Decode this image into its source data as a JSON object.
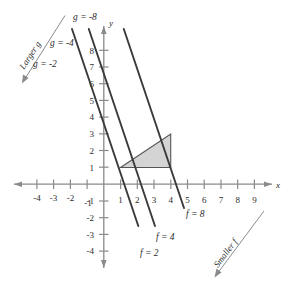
{
  "figure": {
    "title": "",
    "axes": {
      "x_axis_label": "x",
      "y_axis_label": "y",
      "x_ticks": [
        -4,
        -3,
        -2,
        -1,
        1,
        2,
        3,
        4,
        5,
        6,
        7,
        8,
        9
      ],
      "x_tick_labels": [
        "-4",
        "-3",
        "-2",
        "-1",
        "1",
        "2",
        "3",
        "4",
        "5",
        "6",
        "7",
        "8",
        "9"
      ],
      "y_ticks": [
        -4,
        -3,
        -2,
        -1,
        1,
        2,
        3,
        4,
        5,
        6,
        7,
        8
      ],
      "y_tick_labels": [
        "-4",
        "-3",
        "-2",
        "-1",
        "1",
        "2",
        "3",
        "4",
        "5",
        "6",
        "7",
        "8"
      ]
    },
    "annotations": {
      "larger_g": "Larger g",
      "smaller_f": "Smaller f",
      "g_label_1": "g = -8",
      "g_label_2": "g = -4",
      "g_label_3": "g = -2",
      "f_label_1": "f = 8",
      "f_label_2": "f = 4",
      "f_label_3": "f = 2"
    },
    "colors": {
      "line": "#3a3a3a",
      "axis": "#8a8a8a",
      "region_fill": "#d4d4d4",
      "region_stroke": "#555555",
      "text": "#2b2b2b"
    }
  },
  "chart_data": {
    "type": "line",
    "title": "",
    "xlabel": "x",
    "ylabel": "y",
    "xlim": [
      -5,
      10
    ],
    "ylim": [
      -5,
      9
    ],
    "grid": false,
    "legend": "none",
    "series": [
      {
        "name": "f = 2",
        "label": "f = 2",
        "slope": -3,
        "intercept": 3.6,
        "x_intercept": 1.2,
        "points": [
          [
            0.35,
            2.6
          ],
          [
            2.05,
            -2.5
          ]
        ]
      },
      {
        "name": "f = 4",
        "label": "f = 4",
        "slope": -3,
        "intercept": 6.6,
        "x_intercept": 2.2,
        "points": [
          [
            1.35,
            2.6
          ],
          [
            3.1,
            -2.6
          ]
        ]
      },
      {
        "name": "f = 8",
        "label": "f = 8",
        "slope": -3,
        "intercept": 12.9,
        "x_intercept": 4.3,
        "points": [
          [
            3.0,
            3.9
          ],
          [
            4.8,
            -1.4
          ]
        ]
      },
      {
        "name": "g = -2",
        "label": "g = -2",
        "slope": -3,
        "intercept": 3.6,
        "note": "upper-left extension of f = 2 line",
        "points": [
          [
            -1.9,
            9.3
          ],
          [
            0.35,
            2.6
          ]
        ]
      },
      {
        "name": "g = -4",
        "label": "g = -4",
        "slope": -3,
        "intercept": 6.6,
        "note": "upper-left extension of f = 4 line",
        "points": [
          [
            -0.9,
            9.3
          ],
          [
            1.35,
            2.6
          ]
        ]
      },
      {
        "name": "g = -8",
        "label": "g = -8",
        "slope": -3,
        "intercept": 12.9,
        "note": "upper-left extension of f = 8 line",
        "points": [
          [
            1.1,
            9.6
          ],
          [
            3.0,
            3.9
          ]
        ]
      }
    ],
    "shaded_region": {
      "name": "feasible-region",
      "type": "polygon",
      "vertices": [
        [
          1,
          1
        ],
        [
          4,
          1
        ],
        [
          4,
          3
        ]
      ],
      "fill": "#d4d4d4"
    },
    "direction_arrows": [
      {
        "label": "Larger g",
        "from": [
          -2.3,
          8.6
        ],
        "to": [
          -3.9,
          4.6
        ]
      },
      {
        "label": "Smaller f",
        "from": [
          8.3,
          -1.6
        ],
        "to": [
          5.6,
          -4.6
        ]
      }
    ],
    "annotations": [
      {
        "text": "g = -8",
        "x": 1.2,
        "y": 9.4
      },
      {
        "text": "g = -4",
        "x": -0.5,
        "y": 7.1
      },
      {
        "text": "g = -2",
        "x": -2.0,
        "y": 5.5
      },
      {
        "text": "f = 8",
        "x": 5.3,
        "y": -1.9
      },
      {
        "text": "f = 4",
        "x": 3.1,
        "y": -3.3
      },
      {
        "text": "f = 2",
        "x": 2.2,
        "y": -4.1
      }
    ]
  }
}
